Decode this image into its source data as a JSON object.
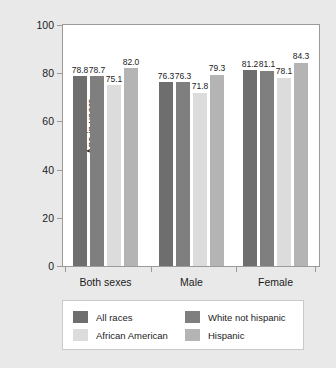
{
  "chart_data": {
    "type": "bar",
    "title": "",
    "xlabel": "",
    "ylabel": "Age in years",
    "ylim": [
      0,
      100
    ],
    "yticks": [
      0,
      20,
      40,
      60,
      80,
      100
    ],
    "ytick_labels": [
      "0",
      "20",
      "40",
      "60",
      "80",
      "100"
    ],
    "grid": false,
    "legend_position": "bottom",
    "categories": [
      "Both sexes",
      "Male",
      "Female"
    ],
    "series": [
      {
        "name": "All races",
        "color": "#6e6e6e",
        "values": [
          78.8,
          76.3,
          81.2
        ]
      },
      {
        "name": "White not hispanic",
        "color": "#7f7f7f",
        "values": [
          78.7,
          76.3,
          81.1
        ]
      },
      {
        "name": "African American",
        "color": "#dcdcdc",
        "values": [
          75.1,
          71.8,
          78.1
        ]
      },
      {
        "name": "Hispanic",
        "color": "#b4b4b4",
        "values": [
          82.0,
          79.3,
          84.3
        ]
      }
    ],
    "value_labels": [
      [
        "78.8",
        "78.7",
        "75.1",
        "82.0"
      ],
      [
        "76.3",
        "76.3",
        "71.8",
        "79.3"
      ],
      [
        "81.2",
        "81.1",
        "78.1",
        "84.3"
      ]
    ],
    "legend_order": [
      "All races",
      "African American",
      "White not hispanic",
      "Hispanic"
    ]
  },
  "figure": {
    "background_color": "#e9e9e9",
    "plot_background_color": "#ffffff",
    "axis_color": "#9a9a9a",
    "text_color": "#1c1c1c"
  }
}
